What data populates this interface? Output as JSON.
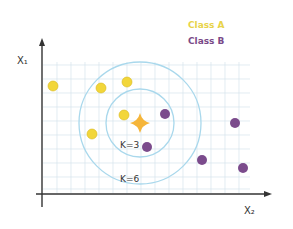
{
  "diagram": {
    "legend": [
      {
        "label": "Class A",
        "color": "#f2d63a"
      },
      {
        "label": "Class B",
        "color": "#7b4b8c"
      }
    ],
    "axes": {
      "x_label": "X₂",
      "y_label": "X₁"
    },
    "circles": [
      {
        "label": "K=3",
        "cx": 140,
        "cy": 123,
        "r": 34
      },
      {
        "label": "K=6",
        "cx": 140,
        "cy": 123,
        "r": 61
      }
    ],
    "query_point": {
      "cx": 140,
      "cy": 123,
      "color": "#f5b53a"
    },
    "class_a_points": [
      {
        "cx": 53,
        "cy": 86
      },
      {
        "cx": 101,
        "cy": 88
      },
      {
        "cx": 127,
        "cy": 82
      },
      {
        "cx": 124,
        "cy": 115
      },
      {
        "cx": 92,
        "cy": 134
      }
    ],
    "class_b_points": [
      {
        "cx": 165,
        "cy": 114
      },
      {
        "cx": 147,
        "cy": 147
      },
      {
        "cx": 235,
        "cy": 123
      },
      {
        "cx": 202,
        "cy": 160
      },
      {
        "cx": 243,
        "cy": 168
      }
    ]
  }
}
